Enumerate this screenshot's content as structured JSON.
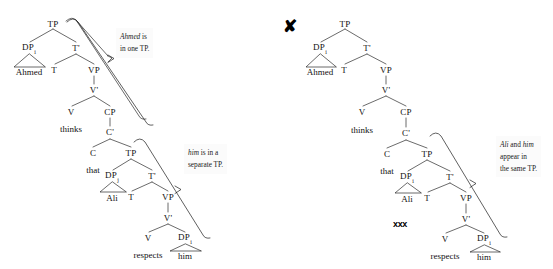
{
  "figure": {
    "type": "syntax-tree-comparison",
    "width": 553,
    "height": 269,
    "background": "#ffffff",
    "ink": "#111111"
  },
  "left_tree": {
    "name": "grammatical-binding-tree",
    "grammatical": true,
    "nodes": [
      {
        "id": "L-TP",
        "label": "TP",
        "x": 53,
        "y": 24
      },
      {
        "id": "L-DPi",
        "label": "DP",
        "sub": "i",
        "x": 29,
        "y": 48
      },
      {
        "id": "L-Tbar",
        "label": "T'",
        "x": 76,
        "y": 48
      },
      {
        "id": "L-T",
        "label": "T",
        "x": 54,
        "y": 70
      },
      {
        "id": "L-VP",
        "label": "VP",
        "x": 94,
        "y": 70
      },
      {
        "id": "L-Vbar",
        "label": "V'",
        "x": 94,
        "y": 90
      },
      {
        "id": "L-V",
        "label": "V",
        "x": 71,
        "y": 112
      },
      {
        "id": "L-CP",
        "label": "CP",
        "x": 110,
        "y": 112
      },
      {
        "id": "L-Cbar",
        "label": "C'",
        "x": 110,
        "y": 132
      },
      {
        "id": "L-C",
        "label": "C",
        "x": 93,
        "y": 153
      },
      {
        "id": "L-TP2",
        "label": "TP",
        "x": 131,
        "y": 153
      },
      {
        "id": "L-DPj",
        "label": "DP",
        "sub": "j",
        "x": 112,
        "y": 176
      },
      {
        "id": "L-Tbar2",
        "label": "T'",
        "x": 152,
        "y": 176
      },
      {
        "id": "L-T2",
        "label": "T",
        "x": 131,
        "y": 197
      },
      {
        "id": "L-VP2",
        "label": "VP",
        "x": 168,
        "y": 197
      },
      {
        "id": "L-Vbar2",
        "label": "V'",
        "x": 168,
        "y": 218
      },
      {
        "id": "L-V2",
        "label": "V",
        "x": 148,
        "y": 238
      },
      {
        "id": "L-DPi2",
        "label": "DP",
        "sub": "i",
        "x": 185,
        "y": 238
      }
    ],
    "terminals": [
      {
        "id": "L-ahmed",
        "label": "Ahmed",
        "x": 29,
        "y": 72
      },
      {
        "id": "L-thinks",
        "label": "thinks",
        "x": 71,
        "y": 129
      },
      {
        "id": "L-that",
        "label": "that",
        "x": 93,
        "y": 170
      },
      {
        "id": "L-ali",
        "label": "Ali",
        "x": 112,
        "y": 198
      },
      {
        "id": "L-respects",
        "label": "respects",
        "x": 148,
        "y": 255
      },
      {
        "id": "L-him",
        "label": "him",
        "x": 185,
        "y": 256
      }
    ],
    "annotations": [
      {
        "id": "L-annot-1",
        "name": "annotation-ahmed-one-tp",
        "lines": [
          [
            {
              "t": "Ahmed",
              "i": true
            },
            {
              "t": " is",
              "i": false
            }
          ],
          [
            {
              "t": "in one TP.",
              "i": false
            }
          ]
        ],
        "x": 116,
        "y": 28
      },
      {
        "id": "L-annot-2",
        "name": "annotation-him-separate-tp",
        "lines": [
          [
            {
              "t": "him",
              "i": true
            },
            {
              "t": " is in a",
              "i": false
            }
          ],
          [
            {
              "t": "separate TP.",
              "i": false
            }
          ]
        ],
        "x": 184,
        "y": 144
      }
    ]
  },
  "right_tree": {
    "name": "ungrammatical-binding-tree",
    "grammatical": false,
    "nodes": [
      {
        "id": "R-TP",
        "label": "TP",
        "x": 345,
        "y": 24
      },
      {
        "id": "R-DPi",
        "label": "DP",
        "sub": "i",
        "x": 320,
        "y": 48
      },
      {
        "id": "R-Tbar",
        "label": "T'",
        "x": 367,
        "y": 48
      },
      {
        "id": "R-T",
        "label": "T",
        "x": 344,
        "y": 70
      },
      {
        "id": "R-VP",
        "label": "VP",
        "x": 386,
        "y": 70
      },
      {
        "id": "R-Vbar",
        "label": "V'",
        "x": 386,
        "y": 90
      },
      {
        "id": "R-V",
        "label": "V",
        "x": 362,
        "y": 112
      },
      {
        "id": "R-CP",
        "label": "CP",
        "x": 406,
        "y": 112
      },
      {
        "id": "R-Cbar",
        "label": "C'",
        "x": 406,
        "y": 133
      },
      {
        "id": "R-C",
        "label": "C",
        "x": 387,
        "y": 154
      },
      {
        "id": "R-TP2",
        "label": "TP",
        "x": 427,
        "y": 154
      },
      {
        "id": "R-DPi2",
        "label": "DP",
        "sub": "i",
        "x": 407,
        "y": 177
      },
      {
        "id": "R-Tbar2",
        "label": "T'",
        "x": 450,
        "y": 177
      },
      {
        "id": "R-T2",
        "label": "T",
        "x": 427,
        "y": 198
      },
      {
        "id": "R-VP2",
        "label": "VP",
        "x": 466,
        "y": 198
      },
      {
        "id": "R-Vbar2",
        "label": "V'",
        "x": 466,
        "y": 219
      },
      {
        "id": "R-V2",
        "label": "V",
        "x": 445,
        "y": 239
      },
      {
        "id": "R-DPi3",
        "label": "DP",
        "sub": "i",
        "x": 484,
        "y": 239
      }
    ],
    "terminals": [
      {
        "id": "R-ahmed",
        "label": "Ahmed",
        "x": 320,
        "y": 72
      },
      {
        "id": "R-thinks",
        "label": "thinks",
        "x": 362,
        "y": 130
      },
      {
        "id": "R-that",
        "label": "that",
        "x": 387,
        "y": 171
      },
      {
        "id": "R-ali",
        "label": "Ali",
        "x": 407,
        "y": 199
      },
      {
        "id": "R-respects",
        "label": "respects",
        "x": 445,
        "y": 256
      },
      {
        "id": "R-him",
        "label": "him",
        "x": 484,
        "y": 257
      }
    ],
    "annotations": [
      {
        "id": "R-annot-1",
        "name": "annotation-ali-him-same-tp",
        "lines": [
          [
            {
              "t": "Ali",
              "i": true
            },
            {
              "t": " and ",
              "i": false
            },
            {
              "t": "him",
              "i": true
            }
          ],
          [
            {
              "t": "appear in",
              "i": false
            }
          ],
          [
            {
              "t": "the same TP.",
              "i": false
            }
          ]
        ],
        "x": 496,
        "y": 136
      }
    ],
    "marks": [
      {
        "id": "R-mark-x",
        "name": "ungrammatical-x-mark",
        "label": "✘",
        "x": 290,
        "y": 26,
        "style": "mark-bigx"
      },
      {
        "id": "R-mark-xxx",
        "name": "ungrammatical-xxx-mark",
        "label": "xxx",
        "x": 400,
        "y": 224,
        "style": "mark-xxx"
      }
    ]
  }
}
